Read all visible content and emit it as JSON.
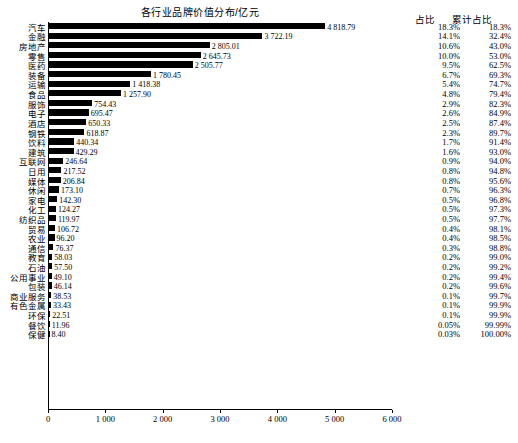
{
  "chart_data": {
    "type": "bar",
    "title": "各行业品牌价值分布/亿元",
    "xlabel": "",
    "ylabel": "",
    "xlim": [
      0,
      6000
    ],
    "xticks": [
      0,
      1000,
      2000,
      3000,
      4000,
      5000,
      6000
    ],
    "xticklabels": [
      "0",
      "1 000",
      "2 000",
      "3 000",
      "4 000",
      "5 000",
      "6 000"
    ],
    "grid": false,
    "orientation": "horizontal",
    "categories": [
      "汽车",
      "金融",
      "房地产",
      "零售",
      "医药",
      "装备",
      "运输",
      "食品",
      "服饰",
      "电子",
      "酒店",
      "钢铁",
      "饮料",
      "建筑",
      "互联网",
      "日用",
      "媒体",
      "休闲",
      "家电",
      "化工",
      "纺织品",
      "贸易",
      "农业",
      "通信",
      "教育",
      "石油",
      "公用事业",
      "包装",
      "商业服务",
      "有色金属",
      "环保",
      "餐饮",
      "保健"
    ],
    "values": [
      4818.79,
      3722.19,
      2805.01,
      2645.73,
      2505.77,
      1780.45,
      1418.38,
      1257.9,
      754.43,
      695.47,
      650.33,
      618.87,
      440.34,
      429.29,
      246.64,
      217.52,
      206.84,
      173.1,
      142.3,
      124.27,
      119.97,
      106.72,
      96.2,
      76.37,
      58.03,
      57.5,
      49.1,
      46.14,
      38.53,
      33.43,
      22.51,
      11.96,
      8.4
    ],
    "value_labels": [
      "4 818.79",
      "3 722.19",
      "2 805.01",
      "2 645.73",
      "2 505.77",
      "1 780.45",
      "1 418.38",
      "1 257.90",
      "754.43",
      "695.47",
      "650.33",
      "618.87",
      "440.34",
      "429.29",
      "246.64",
      "217.52",
      "206.84",
      "173.10",
      "142.30",
      "124.27",
      "119.97",
      "106.72",
      "96.20",
      "76.37",
      "58.03",
      "57.50",
      "49.10",
      "46.14",
      "38.53",
      "33.43",
      "22.51",
      "11.96",
      "8.40"
    ],
    "columns": {
      "share_header": "占比",
      "cumulative_header": "累计占比"
    },
    "share": [
      "18.3%",
      "14.1%",
      "10.6%",
      "10.0%",
      "9.5%",
      "6.7%",
      "5.4%",
      "4.8%",
      "2.9%",
      "2.6%",
      "2.5%",
      "2.3%",
      "1.7%",
      "1.6%",
      "0.9%",
      "0.8%",
      "0.8%",
      "0.7%",
      "0.5%",
      "0.5%",
      "0.5%",
      "0.4%",
      "0.4%",
      "0.3%",
      "0.2%",
      "0.2%",
      "0.2%",
      "0.2%",
      "0.1%",
      "0.1%",
      "0.1%",
      "0.05%",
      "0.03%"
    ],
    "cumulative": [
      "18.3%",
      "32.4%",
      "43.0%",
      "53.0%",
      "62.5%",
      "69.3%",
      "74.7%",
      "79.4%",
      "82.3%",
      "84.9%",
      "87.4%",
      "89.7%",
      "91.4%",
      "93.0%",
      "94.0%",
      "94.8%",
      "95.6%",
      "96.3%",
      "96.8%",
      "97.3%",
      "97.7%",
      "98.1%",
      "98.5%",
      "98.8%",
      "99.0%",
      "99.2%",
      "99.4%",
      "99.6%",
      "99.7%",
      "99.9%",
      "99.9%",
      "99.99%",
      "100.00%"
    ]
  }
}
